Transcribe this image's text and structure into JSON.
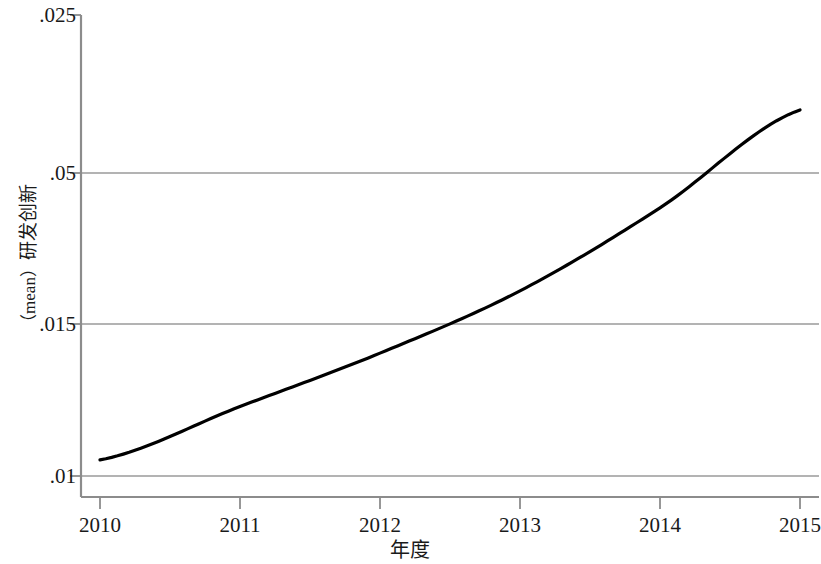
{
  "chart_data": {
    "type": "line",
    "title": "",
    "subtitle": "",
    "xlabel": "年度",
    "ylabel": "（mean）研发创新",
    "x": [
      2010,
      2011,
      2012,
      2013,
      2014,
      2015
    ],
    "series": [
      {
        "name": "研发创新",
        "values": [
          0.01,
          0.0118,
          0.0136,
          0.0157,
          0.0185,
          0.0218
        ]
      }
    ],
    "xticks": [
      "2010",
      "2011",
      "2012",
      "2013",
      "2014",
      "2015"
    ],
    "yticks": [
      ".01",
      ".015",
      ".05",
      ".025"
    ],
    "ytick_values": [
      0.01,
      0.015,
      0.02,
      0.025
    ],
    "xlim": [
      2010,
      2015
    ],
    "ylim": [
      0.00875,
      0.025
    ],
    "grid": "horizontal",
    "legend": "none",
    "line_color": "#000000",
    "grid_color": "#9a9a9a",
    "axis_color": "#8c8c8c"
  },
  "axis": {
    "y_title_prefix": "（mean）",
    "y_title_main": "研发创新",
    "x_title": "年度"
  },
  "y_labels": [
    {
      "text": ".025",
      "y": 15
    },
    {
      "text": ".05",
      "y": 173
    },
    {
      "text": ".015",
      "y": 324
    },
    {
      "text": ".01",
      "y": 476
    }
  ],
  "x_labels": [
    {
      "text": "2010",
      "x": 100
    },
    {
      "text": "2011",
      "x": 240
    },
    {
      "text": "2012",
      "x": 380
    },
    {
      "text": "2013",
      "x": 520
    },
    {
      "text": "2014",
      "x": 660
    },
    {
      "text": "2015",
      "x": 800
    }
  ],
  "colors": {
    "line": "#000000",
    "grid": "#9a9a9a",
    "axis": "#8c8c8c",
    "background": "#ffffff",
    "text": "#1a1a1a"
  }
}
